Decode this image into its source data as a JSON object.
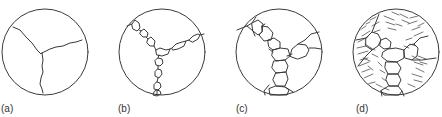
{
  "figure": {
    "panels": [
      {
        "id": "a",
        "label": "(a)",
        "description": "Single grain boundary triple junction, no precipitates"
      },
      {
        "id": "b",
        "label": "(b)",
        "description": "Small discrete precipitates along grain boundaries"
      },
      {
        "id": "c",
        "label": "(c)",
        "description": "Larger blocky precipitates forming continuous network along grain boundaries"
      },
      {
        "id": "d",
        "label": "(d)",
        "description": "Grain boundary network plus lamellar (pearlitic/eutectoid) structure within grains"
      }
    ],
    "colors": {
      "stroke": "#3a3a3a",
      "background": "#ffffff",
      "label": "#333333"
    }
  }
}
